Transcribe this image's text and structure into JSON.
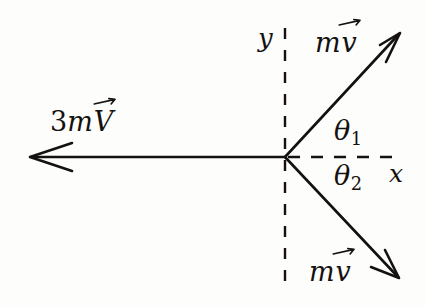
{
  "figure": {
    "name": "momentum-vector-diagram",
    "background_color": "#fdfdfc",
    "stroke_color": "#14110f",
    "width": 425,
    "height": 307
  },
  "axes": {
    "origin": {
      "x": 285,
      "y": 157
    },
    "y_axis": {
      "label": "y",
      "style": "dashed",
      "x": 285,
      "y_top": 28,
      "y_bottom": 291
    },
    "x_axis": {
      "label": "x",
      "style": "dashed",
      "y": 157,
      "x_start": 285,
      "x_end": 401
    }
  },
  "vectors": [
    {
      "name": "incoming-momentum",
      "label_prefix": "3m",
      "label_vector_symbol": "V",
      "label_text": "3mV",
      "direction": "left",
      "angle_deg": 180,
      "style": "solid",
      "tail": {
        "x": 285,
        "y": 157
      },
      "tip": {
        "x": 30,
        "y": 157
      }
    },
    {
      "name": "outgoing-momentum-upper",
      "label_prefix": "m",
      "label_vector_symbol": "v",
      "label_text": "mv",
      "direction": "up-right",
      "angle_deg": 47,
      "style": "solid",
      "tail": {
        "x": 285,
        "y": 157
      },
      "tip": {
        "x": 400,
        "y": 33
      }
    },
    {
      "name": "outgoing-momentum-lower",
      "label_prefix": "m",
      "label_vector_symbol": "v",
      "label_text": "mv",
      "direction": "down-right",
      "angle_deg": -46,
      "style": "solid",
      "tail": {
        "x": 285,
        "y": 157
      },
      "tip": {
        "x": 399,
        "y": 278
      }
    }
  ],
  "angles": [
    {
      "name": "theta-1",
      "symbol": "θ",
      "subscript": "1",
      "between": "x-axis and upper outgoing momentum"
    },
    {
      "name": "theta-2",
      "symbol": "θ",
      "subscript": "2",
      "between": "x-axis and lower outgoing momentum"
    }
  ]
}
